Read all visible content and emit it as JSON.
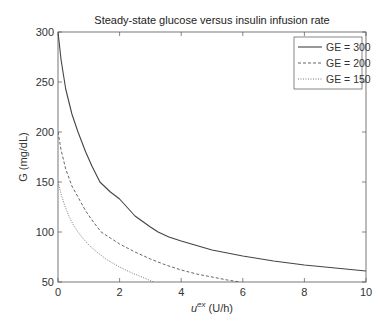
{
  "chart_data": {
    "type": "line",
    "title": "Steady-state glucose versus insulin infusion rate",
    "xlabel": "u^ex (U/h)",
    "xlabel_base": "u",
    "xlabel_sup": "ex",
    "xlabel_unit": " (U/h)",
    "ylabel": "G (mg/dL)",
    "xlim": [
      0,
      10
    ],
    "ylim": [
      50,
      300
    ],
    "xticks": [
      0,
      2,
      4,
      6,
      8,
      10
    ],
    "yticks": [
      50,
      100,
      150,
      200,
      250,
      300
    ],
    "xtick_labels": [
      "0",
      "2",
      "4",
      "6",
      "8",
      "10"
    ],
    "ytick_labels": [
      "50",
      "100",
      "150",
      "200",
      "250",
      "300"
    ],
    "grid": false,
    "legend_position": "upper right",
    "series": [
      {
        "name": "GE = 300",
        "style": "solid",
        "color": "#444444",
        "x": [
          0,
          0.1,
          0.25,
          0.45,
          0.65,
          0.9,
          1.1,
          1.36,
          1.7,
          2.0,
          2.5,
          3.0,
          3.25,
          3.6,
          4.0,
          5.0,
          6.0,
          7.0,
          8.0,
          9.0,
          10.0
        ],
        "y": [
          300,
          272,
          243,
          218,
          200,
          180,
          166,
          150,
          140,
          133,
          116,
          105,
          100,
          95,
          91,
          82,
          76,
          71,
          67,
          64,
          61
        ]
      },
      {
        "name": "GE = 200",
        "style": "dashed",
        "color": "#555555",
        "x": [
          0,
          0.1,
          0.25,
          0.45,
          0.65,
          0.9,
          1.1,
          1.4,
          1.7,
          2.0,
          2.5,
          3.0,
          3.5,
          4.0,
          4.5,
          5.0,
          5.5,
          5.9
        ],
        "y": [
          200,
          182,
          163,
          146,
          135,
          121,
          112,
          100,
          94,
          88,
          80,
          73,
          67,
          62,
          58,
          55,
          52,
          50
        ]
      },
      {
        "name": "GE = 150",
        "style": "dotted",
        "color": "#666666",
        "x": [
          0,
          0.1,
          0.2,
          0.35,
          0.5,
          0.65,
          0.8,
          1.0,
          1.3,
          1.6,
          2.0,
          2.4,
          2.8,
          3.1
        ],
        "y": [
          150,
          138,
          128,
          116,
          107,
          100,
          94,
          87,
          79,
          72,
          65,
          59,
          54,
          50
        ]
      }
    ]
  }
}
